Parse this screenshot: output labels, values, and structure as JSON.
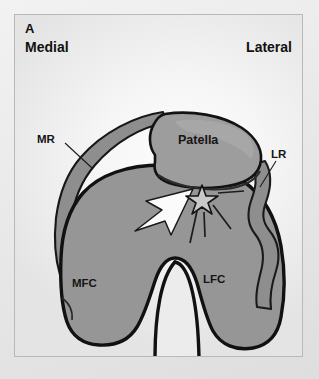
{
  "figure": {
    "panel_letter": "A",
    "orientation": {
      "left_label": "Medial",
      "right_label": "Lateral"
    },
    "labels": {
      "medial_retinaculum_abbr": "MR",
      "lateral_retinaculum_abbr": "LR",
      "patella": "Patella",
      "medial_femoral_condyle_abbr": "MFC",
      "lateral_femoral_condyle_abbr": "LFC"
    },
    "markers": {
      "arrowhead_name": "white-arrowhead-marker",
      "star_name": "star-marker"
    },
    "colors": {
      "bone_fill": "#969696",
      "bone_outline": "#111111",
      "patella_fill": "#9d9d9d",
      "retinaculum_fill": "#8e8e8e",
      "retinaculum_outline": "#1a1a1a",
      "notch_fill": "#e8e8e8",
      "arrow_fill": "#fbfbfb",
      "panel_border": "#b9b9b9",
      "text": "#111111"
    }
  }
}
